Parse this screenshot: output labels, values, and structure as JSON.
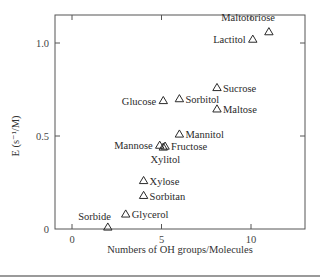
{
  "chart_data": {
    "type": "scatter",
    "title": "",
    "xlabel": "Numbers of OH groups/Molecules",
    "ylabel": "E (s⁻¹/M)",
    "xlim": [
      -0.95,
      13
    ],
    "ylim": [
      0,
      1.15
    ],
    "x_ticks": [
      0,
      5,
      10
    ],
    "x_tick_labels": [
      "0",
      "5",
      "10"
    ],
    "y_ticks": [
      0,
      0.5,
      1.0
    ],
    "y_tick_labels": [
      "0",
      "0.5",
      "1.0"
    ],
    "grid": false,
    "legend": null,
    "marker": "open-triangle",
    "points": [
      {
        "label": "Maltotoriose",
        "x": 11.0,
        "y": 1.06,
        "label_pos": "above-left"
      },
      {
        "label": "Lactitol",
        "x": 10.1,
        "y": 1.02,
        "label_pos": "left"
      },
      {
        "label": "Sucrose",
        "x": 8.1,
        "y": 0.76,
        "label_pos": "right"
      },
      {
        "label": "Glucose",
        "x": 5.1,
        "y": 0.69,
        "label_pos": "left"
      },
      {
        "label": "Sorbitol",
        "x": 6.0,
        "y": 0.7,
        "label_pos": "right"
      },
      {
        "label": "Maltose",
        "x": 8.1,
        "y": 0.645,
        "label_pos": "right"
      },
      {
        "label": "Mannitol",
        "x": 6.0,
        "y": 0.51,
        "label_pos": "right"
      },
      {
        "label": "Mannose",
        "x": 4.9,
        "y": 0.45,
        "label_pos": "left"
      },
      {
        "label": "Fructose",
        "x": 5.2,
        "y": 0.445,
        "label_pos": "right"
      },
      {
        "label": "Xylitol",
        "x": 5.1,
        "y": 0.44,
        "label_pos": "below"
      },
      {
        "label": "Xylose",
        "x": 4.0,
        "y": 0.26,
        "label_pos": "right"
      },
      {
        "label": "Sorbitan",
        "x": 4.0,
        "y": 0.18,
        "label_pos": "right"
      },
      {
        "label": "Glycerol",
        "x": 3.0,
        "y": 0.08,
        "label_pos": "right"
      },
      {
        "label": "Sorbide",
        "x": 2.0,
        "y": 0.01,
        "label_pos": "above-left"
      }
    ]
  },
  "colors": {
    "axis": "#555555",
    "marker": "#2a2a2a",
    "text": "#2a2a2a"
  }
}
